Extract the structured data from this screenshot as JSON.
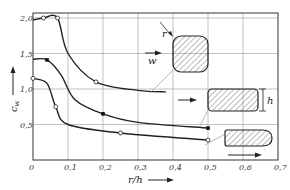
{
  "chart_data": {
    "type": "line",
    "title": "",
    "xlabel": "r/h",
    "ylabel": "c_w",
    "xlim": [
      0,
      0.7
    ],
    "ylim": [
      0,
      2.0
    ],
    "grid": true,
    "x_ticks": [
      "0",
      "0,1",
      "0,2",
      "0,3",
      "0,4",
      "0,5",
      "0,6",
      "0,7"
    ],
    "y_ticks": [
      "0,5",
      "1,0",
      "1,5",
      "2,0"
    ],
    "series": [
      {
        "name": "square section (rounded corners)",
        "marker": "open-circle",
        "x": [
          0,
          0.03,
          0.07,
          0.1,
          0.18,
          0.3,
          0.38
        ],
        "y": [
          1.97,
          2.0,
          2.0,
          1.5,
          1.1,
          0.98,
          0.96
        ]
      },
      {
        "name": "rectangular section",
        "marker": "filled-square",
        "x": [
          0,
          0.04,
          0.08,
          0.12,
          0.2,
          0.3,
          0.5
        ],
        "y": [
          1.42,
          1.41,
          1.2,
          0.85,
          0.65,
          0.53,
          0.45
        ]
      },
      {
        "name": "elongated rectangular section (rounded nose)",
        "marker": "open-circle",
        "x": [
          0,
          0.04,
          0.065,
          0.1,
          0.25,
          0.45,
          0.5
        ],
        "y": [
          1.15,
          1.08,
          0.75,
          0.5,
          0.38,
          0.3,
          0.28
        ]
      }
    ],
    "annotations": [
      "r",
      "w",
      "h"
    ]
  },
  "labels": {
    "y_axis": "c",
    "y_axis_sub": "w",
    "x_axis": "r/h",
    "radius": "r",
    "velocity": "w",
    "height": "h"
  }
}
